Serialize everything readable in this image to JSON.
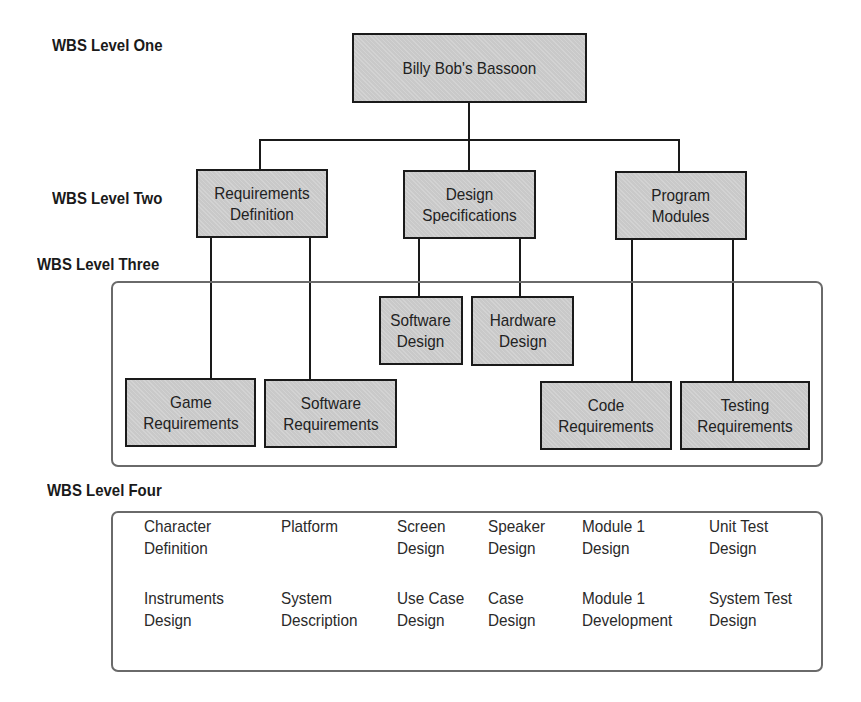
{
  "levels": {
    "one": "WBS Level One",
    "two": "WBS Level Two",
    "three": "WBS Level Three",
    "four": "WBS Level Four"
  },
  "level1": {
    "root": "Billy Bob's Bassoon"
  },
  "level2": {
    "requirements_definition": "Requirements\nDefinition",
    "design_specifications": "Design\nSpecifications",
    "program_modules": "Program\nModules"
  },
  "level3": {
    "game_requirements": "Game\nRequirements",
    "software_requirements": "Software\nRequirements",
    "software_design": "Software\nDesign",
    "hardware_design": "Hardware\nDesign",
    "code_requirements": "Code\nRequirements",
    "testing_requirements": "Testing\nRequirements"
  },
  "level4": {
    "row1": [
      "Character\nDefinition",
      "Platform",
      "Screen\nDesign",
      "Speaker\nDesign",
      "Module 1\nDesign",
      "Unit Test\nDesign"
    ],
    "row2": [
      "Instruments\nDesign",
      "System\nDescription",
      "Use Case\nDesign",
      "Case\nDesign",
      "Module 1\nDevelopment",
      "System Test\nDesign"
    ]
  },
  "colors": {
    "node_fill": "#c9c9c9",
    "node_border": "#1a1a1a",
    "group_border": "#6a6a6a"
  }
}
